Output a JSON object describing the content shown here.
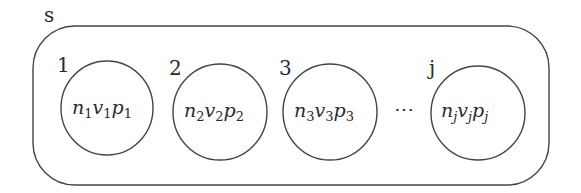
{
  "diagram": {
    "container": {
      "label": "s"
    },
    "sets": [
      {
        "index_label": "1",
        "content": {
          "n": "n",
          "v": "v",
          "p": "p",
          "sub": "1"
        }
      },
      {
        "index_label": "2",
        "content": {
          "n": "n",
          "v": "v",
          "p": "p",
          "sub": "2"
        }
      },
      {
        "index_label": "3",
        "content": {
          "n": "n",
          "v": "v",
          "p": "p",
          "sub": "3"
        }
      },
      {
        "index_label": "j",
        "content": {
          "n": "n",
          "v": "v",
          "p": "p",
          "sub": "j"
        }
      }
    ],
    "ellipsis": "⋯",
    "colors": {
      "stroke": "#444444",
      "text": "#2a2a2a",
      "background": "#ffffff"
    }
  }
}
